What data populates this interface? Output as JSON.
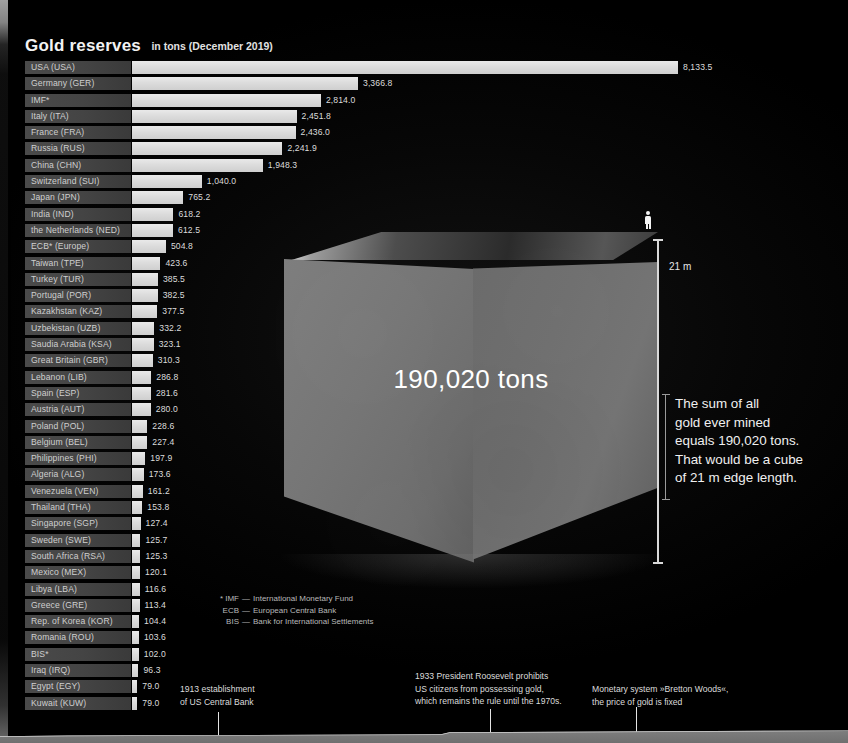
{
  "chart_data": {
    "type": "bar",
    "title": "Gold reserves",
    "subtitle": "in tons (December 2019)",
    "xlabel": "",
    "ylabel": "",
    "unit": "tons",
    "xlim": [
      0,
      8133.5
    ],
    "grid": false,
    "legend": "none",
    "orientation": "horizontal",
    "categories": [
      "USA (USA)",
      "Germany (GER)",
      "IMF*",
      "Italy (ITA)",
      "France (FRA)",
      "Russia (RUS)",
      "China (CHN)",
      "Switzerland (SUI)",
      "Japan (JPN)",
      "India (IND)",
      "the Netherlands (NED)",
      "ECB* (Europe)",
      "Taiwan (TPE)",
      "Turkey (TUR)",
      "Portugal (POR)",
      "Kazakhstan (KAZ)",
      "Uzbekistan (UZB)",
      "Saudia Arabia (KSA)",
      "Great Britain (GBR)",
      "Lebanon (LIB)",
      "Spain (ESP)",
      "Austria (AUT)",
      "Poland (POL)",
      "Belgium (BEL)",
      "Philippines (PHI)",
      "Algeria (ALG)",
      "Venezuela (VEN)",
      "Thailand (THA)",
      "Singapore (SGP)",
      "Sweden (SWE)",
      "South Africa (RSA)",
      "Mexico (MEX)",
      "Libya (LBA)",
      "Greece (GRE)",
      "Rep. of Korea (KOR)",
      "Romania (ROU)",
      "BIS*",
      "Iraq (IRQ)",
      "Egypt (EGY)",
      "Kuwait (KUW)"
    ],
    "values": [
      8133.5,
      3366.8,
      2814.0,
      2451.8,
      2436.0,
      2241.9,
      1948.3,
      1040.0,
      765.2,
      618.2,
      612.5,
      504.8,
      423.6,
      385.5,
      382.5,
      377.5,
      332.2,
      323.1,
      310.3,
      286.8,
      281.6,
      280.0,
      228.6,
      227.4,
      197.9,
      173.6,
      161.2,
      153.8,
      127.4,
      125.7,
      125.3,
      120.1,
      116.6,
      113.4,
      104.4,
      103.6,
      102.0,
      96.3,
      79.0,
      79.0
    ],
    "value_labels": [
      "8,133.5",
      "3,366.8",
      "2,814.0",
      "2,451.8",
      "2,436.0",
      "2,241.9",
      "1,948.3",
      "1,040.0",
      "765.2",
      "618.2",
      "612.5",
      "504.8",
      "423.6",
      "385.5",
      "382.5",
      "377.5",
      "332.2",
      "323.1",
      "310.3",
      "286.8",
      "281.6",
      "280.0",
      "228.6",
      "227.4",
      "197.9",
      "173.6",
      "161.2",
      "153.8",
      "127.4",
      "125.7",
      "125.3",
      "120.1",
      "116.6",
      "113.4",
      "104.4",
      "103.6",
      "102.0",
      "96.3",
      "79.0",
      "79.0"
    ]
  },
  "footnote": {
    "marker": "*",
    "entries": [
      {
        "abbr": "IMF",
        "dash": "—",
        "expansion": "International Monetary Fund"
      },
      {
        "abbr": "ECB",
        "dash": "—",
        "expansion": "European Central Bank"
      },
      {
        "abbr": "BIS",
        "dash": "—",
        "expansion": "Bank for International Settlements"
      }
    ]
  },
  "cube": {
    "caption": "190,020 tons",
    "height_label": "21 m",
    "person_icon": "person-icon"
  },
  "statement": {
    "line1": "The sum of all",
    "line2": "gold ever mined",
    "line3": "equals 190,020 tons.",
    "line4": "That would be a cube",
    "line5": "of 21 m edge length."
  },
  "timeline": {
    "events": [
      {
        "line1": "1913 establishment",
        "line2": "of US Central Bank",
        "line3": ""
      },
      {
        "line1": "1933 President Roosevelt prohibits",
        "line2": "US citizens from possessing gold,",
        "line3": "which remains the rule until the 1970s."
      },
      {
        "line1": "Monetary system »Bretton Woods«,",
        "line2": "the price of gold is fixed",
        "line3": ""
      }
    ]
  },
  "colors": {
    "background": "#030303",
    "bar_fill": "#dcdcdc",
    "label_box": "#444444",
    "text": "#e8e8e8",
    "cube_face": "#747474",
    "accent_rule": "#d9d9d9"
  }
}
